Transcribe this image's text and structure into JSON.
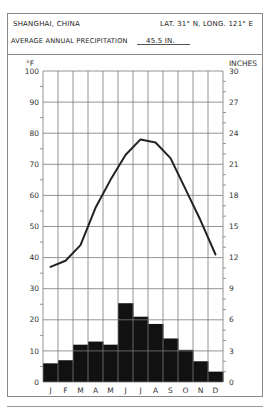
{
  "header": {
    "location": "SHANGHAI, CHINA",
    "coordinates": "LAT. 31° N, LONG. 121° E",
    "precip_label": "AVERAGE ANNUAL PRECIPITATION",
    "precip_value": "45.5 IN."
  },
  "colors": {
    "bar": "#111111",
    "line": "#222222",
    "grid": "#7a7a7a",
    "border": "#8a8a8a"
  },
  "chart_data": {
    "type": "bar+line",
    "title": "SHANGHAI, CHINA",
    "subtitle": "LAT. 31° N, LONG. 121° E — AVERAGE ANNUAL PRECIPITATION 45.5 IN.",
    "categories": [
      "J",
      "F",
      "M",
      "A",
      "M",
      "J",
      "J",
      "A",
      "S",
      "O",
      "N",
      "D"
    ],
    "series": [
      {
        "name": "Temperature (°F)",
        "type": "line",
        "axis": "left",
        "values": [
          37,
          39,
          44,
          56,
          65,
          73,
          78,
          77,
          72,
          62,
          52,
          41
        ]
      },
      {
        "name": "Precipitation (inches)",
        "type": "bar",
        "axis": "right",
        "values": [
          1.8,
          2.1,
          3.6,
          3.9,
          3.6,
          7.6,
          6.3,
          5.6,
          4.2,
          3.1,
          2.0,
          1.0
        ]
      }
    ],
    "left_axis": {
      "label": "°F",
      "ylim": [
        0,
        100
      ],
      "ticks": [
        0,
        10,
        20,
        30,
        40,
        50,
        60,
        70,
        80,
        90,
        100
      ]
    },
    "right_axis": {
      "label": "INCHES",
      "ylim": [
        0,
        30
      ],
      "ticks": [
        0,
        3,
        6,
        9,
        12,
        15,
        18,
        21,
        24,
        27,
        30
      ]
    },
    "grid": true,
    "legend": "none"
  }
}
